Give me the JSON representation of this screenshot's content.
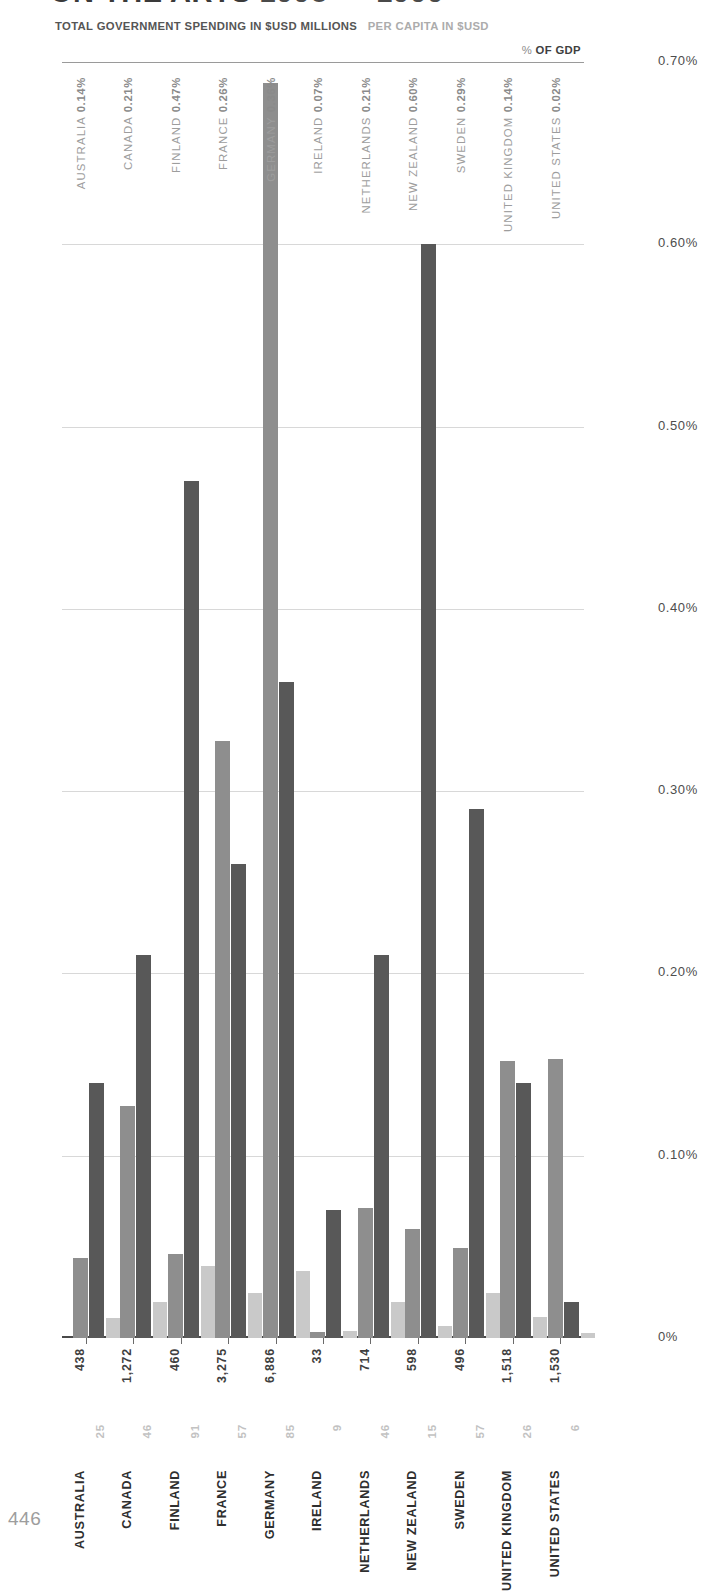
{
  "title": {
    "main": "ON THE ARTS",
    "years": "1998 — 1999"
  },
  "subtitle": {
    "total_label": "TOTAL GOVERNMENT SPENDING IN $USD MILLIONS",
    "percapita_label": "PER CAPITA IN $USD"
  },
  "legend": {
    "gdp_prefix": "%",
    "gdp_label": "OF GDP"
  },
  "page_number": "446",
  "colors": {
    "total": "#8e8e8e",
    "gdp": "#585858",
    "per_capita": "#c9c9c9",
    "grid": "#d8d8d8",
    "axis": "#4a4a4a"
  },
  "axes": {
    "left_ticks": [
      "7000",
      "6000",
      "5000",
      "4000",
      "3000",
      "2000",
      "1000",
      "0"
    ],
    "right_ticks": [
      "0.70%",
      "0.60%",
      "0.50%",
      "0.40%",
      "0.30%",
      "0.20%",
      "0.10%",
      "0%"
    ]
  },
  "chart_data": {
    "type": "bar",
    "title": "ON THE ARTS 1998 — 1999",
    "xlabel": "",
    "ylabel": "TOTAL GOVERNMENT SPENDING IN $USD MILLIONS",
    "y2label": "% OF GDP",
    "ylim": [
      0,
      7000
    ],
    "y2lim": [
      0,
      0.7
    ],
    "grid": true,
    "legend_position": "top-right",
    "categories": [
      "AUSTRALIA",
      "CANADA",
      "FINLAND",
      "FRANCE",
      "GERMANY",
      "IRELAND",
      "NETHERLANDS",
      "NEW ZEALAND",
      "SWEDEN",
      "UNITED KINGDOM",
      "UNITED STATES"
    ],
    "series": [
      {
        "name": "TOTAL GOVERNMENT SPENDING IN $USD MILLIONS",
        "axis": "left",
        "color": "#8e8e8e",
        "values": [
          438,
          1272,
          460,
          3275,
          6886,
          33,
          714,
          598,
          496,
          1518,
          1530
        ],
        "labels": [
          "438",
          "1,272",
          "460",
          "3,275",
          "6,886",
          "33",
          "714",
          "598",
          "496",
          "1,518",
          "1,530"
        ]
      },
      {
        "name": "% OF GDP",
        "axis": "right",
        "color": "#585858",
        "values": [
          0.14,
          0.21,
          0.47,
          0.26,
          0.36,
          0.07,
          0.21,
          0.6,
          0.29,
          0.14,
          0.02
        ],
        "labels": [
          "0.14%",
          "0.21%",
          "0.47%",
          "0.26%",
          "0.36%",
          "0.07%",
          "0.21%",
          "0.60%",
          "0.29%",
          "0.14%",
          "0.02%"
        ]
      },
      {
        "name": "PER CAPITA IN $USD",
        "axis": "left-scaled",
        "color": "#c9c9c9",
        "values": [
          25,
          46,
          91,
          57,
          85,
          9,
          46,
          15,
          57,
          26,
          6
        ],
        "labels": [
          "25",
          "46",
          "91",
          "57",
          "85",
          "9",
          "46",
          "15",
          "57",
          "26",
          "6"
        ]
      }
    ],
    "countries": [
      {
        "name": "AUSTRALIA",
        "total": 438,
        "total_label": "438",
        "per_capita": 25,
        "per_capita_label": "25",
        "gdp_pct": 0.14,
        "gdp_pct_label": "0.14%"
      },
      {
        "name": "CANADA",
        "total": 1272,
        "total_label": "1,272",
        "per_capita": 46,
        "per_capita_label": "46",
        "gdp_pct": 0.21,
        "gdp_pct_label": "0.21%"
      },
      {
        "name": "FINLAND",
        "total": 460,
        "total_label": "460",
        "per_capita": 91,
        "per_capita_label": "91",
        "gdp_pct": 0.47,
        "gdp_pct_label": "0.47%"
      },
      {
        "name": "FRANCE",
        "total": 3275,
        "total_label": "3,275",
        "per_capita": 57,
        "per_capita_label": "57",
        "gdp_pct": 0.26,
        "gdp_pct_label": "0.26%"
      },
      {
        "name": "GERMANY",
        "total": 6886,
        "total_label": "6,886",
        "per_capita": 85,
        "per_capita_label": "85",
        "gdp_pct": 0.36,
        "gdp_pct_label": "0.36%"
      },
      {
        "name": "IRELAND",
        "total": 33,
        "total_label": "33",
        "per_capita": 9,
        "per_capita_label": "9",
        "gdp_pct": 0.07,
        "gdp_pct_label": "0.07%"
      },
      {
        "name": "NETHERLANDS",
        "total": 714,
        "total_label": "714",
        "per_capita": 46,
        "per_capita_label": "46",
        "gdp_pct": 0.21,
        "gdp_pct_label": "0.21%"
      },
      {
        "name": "NEW ZEALAND",
        "total": 598,
        "total_label": "598",
        "per_capita": 15,
        "per_capita_label": "15",
        "gdp_pct": 0.6,
        "gdp_pct_label": "0.60%"
      },
      {
        "name": "SWEDEN",
        "total": 496,
        "total_label": "496",
        "per_capita": 57,
        "per_capita_label": "57",
        "gdp_pct": 0.29,
        "gdp_pct_label": "0.29%"
      },
      {
        "name": "UNITED KINGDOM",
        "total": 1518,
        "total_label": "1,518",
        "per_capita": 26,
        "per_capita_label": "26",
        "gdp_pct": 0.14,
        "gdp_pct_label": "0.14%"
      },
      {
        "name": "UNITED STATES",
        "total": 1530,
        "total_label": "1,530",
        "per_capita": 6,
        "per_capita_label": "6",
        "gdp_pct": 0.02,
        "gdp_pct_label": "0.02%"
      }
    ]
  }
}
